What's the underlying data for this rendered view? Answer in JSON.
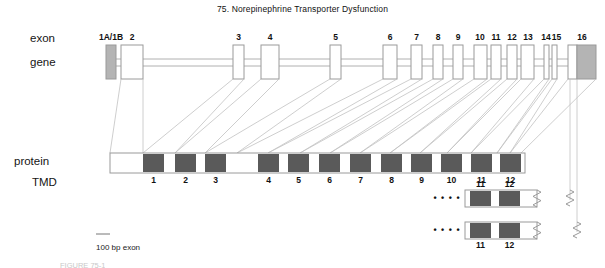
{
  "figure": {
    "title": "75.  Norepinephrine Transporter Dysfunction",
    "caption_cut": "FIGURE 75-1",
    "scale_label": "100 bp exon"
  },
  "row_labels": {
    "exon": "exon",
    "gene": "gene",
    "protein": "protein",
    "tmd": "TMD"
  },
  "colors": {
    "exon_fill_white": "#ffffff",
    "exon_fill_gray": "#b4b4b4",
    "exon_stroke": "#9a9a9a",
    "intron_line": "#b0b0b0",
    "connector_line": "#c2c2c2",
    "tmd_fill": "#5a5a5a",
    "protein_stroke": "#9a9a9a",
    "text": "#111111"
  },
  "gene": {
    "exons": [
      {
        "label": "1A/1B",
        "x": 106,
        "width": 10,
        "fill": "gray",
        "label_x": 96,
        "label_w": 30
      },
      {
        "label": "2",
        "x": 121,
        "width": 22,
        "fill": "white",
        "label_x": 121,
        "label_w": 22
      },
      {
        "label": "3",
        "x": 233,
        "width": 11,
        "fill": "white",
        "label_x": 233,
        "label_w": 11
      },
      {
        "label": "4",
        "x": 261,
        "width": 18,
        "fill": "white",
        "label_x": 261,
        "label_w": 18
      },
      {
        "label": "5",
        "x": 330,
        "width": 11,
        "fill": "white",
        "label_x": 330,
        "label_w": 11
      },
      {
        "label": "6",
        "x": 383,
        "width": 14,
        "fill": "white",
        "label_x": 383,
        "label_w": 14
      },
      {
        "label": "7",
        "x": 411,
        "width": 11,
        "fill": "white",
        "label_x": 411,
        "label_w": 11
      },
      {
        "label": "8",
        "x": 433,
        "width": 10,
        "fill": "white",
        "label_x": 433,
        "label_w": 10
      },
      {
        "label": "9",
        "x": 453,
        "width": 10,
        "fill": "white",
        "label_x": 453,
        "label_w": 10
      },
      {
        "label": "10",
        "x": 474,
        "width": 13,
        "fill": "white",
        "label_x": 472,
        "label_w": 16
      },
      {
        "label": "11",
        "x": 491,
        "width": 10,
        "fill": "white",
        "label_x": 489,
        "label_w": 14
      },
      {
        "label": "12",
        "x": 507,
        "width": 10,
        "fill": "white",
        "label_x": 505,
        "label_w": 14
      },
      {
        "label": "13",
        "x": 521,
        "width": 13,
        "fill": "white",
        "label_x": 521,
        "label_w": 14
      },
      {
        "label": "14",
        "x": 544,
        "width": 5,
        "fill": "white",
        "label_x": 539,
        "label_w": 14
      },
      {
        "label": "15",
        "x": 552,
        "width": 5,
        "fill": "white",
        "label_x": 550,
        "label_w": 13
      },
      {
        "label": "16",
        "x": 568,
        "width": 28,
        "fill": "split",
        "label_x": 568,
        "label_w": 28
      }
    ],
    "exon_box_top": 45,
    "exon_box_height": 34,
    "intron_y_top": 59,
    "intron_y_bottom": 66,
    "intron_start_x": 116,
    "intron_end_x": 570
  },
  "protein": {
    "bar_x": 110,
    "bar_y": 153,
    "bar_width": 415,
    "bar_height": 20,
    "tmds": [
      {
        "label": "1",
        "x": 143,
        "width": 21
      },
      {
        "label": "2",
        "x": 175,
        "width": 21
      },
      {
        "label": "3",
        "x": 205,
        "width": 21
      },
      {
        "label": "4",
        "x": 258,
        "width": 21
      },
      {
        "label": "5",
        "x": 288,
        "width": 21
      },
      {
        "label": "6",
        "x": 319,
        "width": 21
      },
      {
        "label": "7",
        "x": 350,
        "width": 21
      },
      {
        "label": "8",
        "x": 381,
        "width": 21
      },
      {
        "label": "9",
        "x": 411,
        "width": 21
      },
      {
        "label": "10",
        "x": 441,
        "width": 21
      },
      {
        "label": "11",
        "x": 471,
        "width": 21
      },
      {
        "label": "12",
        "x": 500,
        "width": 21
      }
    ]
  },
  "splice_variants": [
    {
      "name": "variant-1",
      "bar_x": 465,
      "bar_y": 190,
      "bar_width": 72,
      "bar_height": 17,
      "dots_x": 432,
      "dots_y": 198,
      "dots": "• • • •",
      "tmds": [
        {
          "label": "11",
          "x": 470,
          "width": 21
        },
        {
          "label": "12",
          "x": 499,
          "width": 21
        }
      ],
      "labels_above": true
    },
    {
      "name": "variant-2",
      "bar_x": 465,
      "bar_y": 222,
      "bar_width": 72,
      "bar_height": 17,
      "dots_x": 432,
      "dots_y": 230,
      "dots": "• • • •",
      "tmds": [
        {
          "label": "11",
          "x": 470,
          "width": 21
        },
        {
          "label": "12",
          "x": 499,
          "width": 21
        }
      ],
      "labels_above": false
    }
  ],
  "scale_bar": {
    "x": 96,
    "y": 234,
    "width": 14
  }
}
